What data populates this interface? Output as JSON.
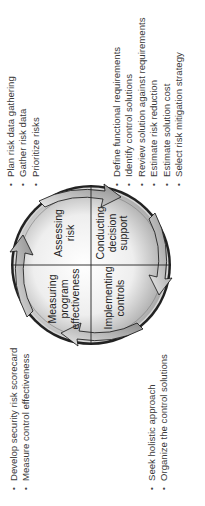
{
  "diagram": {
    "quadrants": [
      {
        "name": "assessing-risk",
        "lines": [
          "Assessing",
          "risk"
        ]
      },
      {
        "name": "conducting-decision-support",
        "lines": [
          "Conducting",
          "decision",
          "support"
        ]
      },
      {
        "name": "implementing-controls",
        "lines": [
          "Implementing",
          "controls"
        ]
      },
      {
        "name": "measuring-program-effectiveness",
        "lines": [
          "Measuring",
          "program",
          "effectiveness"
        ]
      }
    ],
    "colors": {
      "ring_outer": "#1a1a1a",
      "fill_light": "#f4f4f4",
      "fill_dark": "#9a9a9a",
      "arrow": "#b8b8b8",
      "line": "#222222"
    }
  },
  "lists": {
    "assessing": [
      "Plan risk data gathering",
      "Gather risk data",
      "Prioritize risks"
    ],
    "decision": [
      "Define functional requirements",
      "Identify control solutions",
      "Review solution against requirements",
      "Estimate risk reduction",
      "Estimate solution cost",
      "Select risk mitigation strategy"
    ],
    "measuring": [
      "Develop security risk scorecard",
      "Measure control effectiveness"
    ],
    "implementing": [
      "Seek holistic approach",
      "Organize the control solutions"
    ]
  }
}
